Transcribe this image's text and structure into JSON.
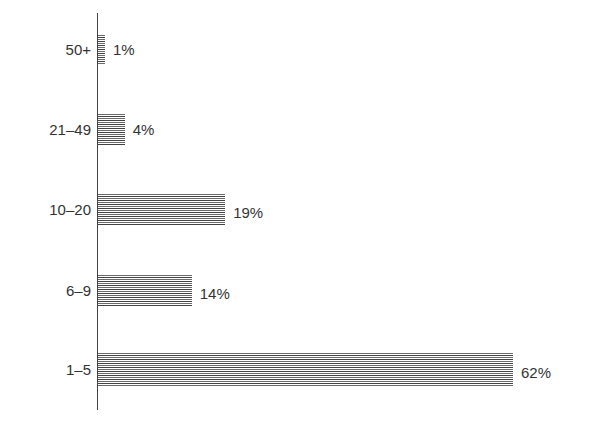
{
  "chart_data": {
    "type": "bar",
    "orientation": "horizontal",
    "title": "",
    "xlabel": "",
    "ylabel": "",
    "categories": [
      "50+",
      "21–49",
      "10–20",
      "6–9",
      "1–5"
    ],
    "values": [
      1,
      4,
      19,
      14,
      62
    ],
    "value_labels": [
      "1%",
      "4%",
      "19%",
      "14%",
      "62%"
    ],
    "unit": "%",
    "xlim": [
      0,
      62
    ],
    "grid": false,
    "legend": null,
    "bar_style": "horizontal-line hatching",
    "colors": {
      "bar": "#3a3a3a",
      "axis": "#444444",
      "text": "#333333"
    }
  }
}
